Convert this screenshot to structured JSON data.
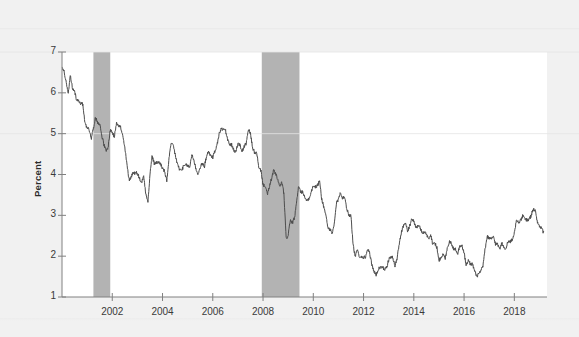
{
  "chart_data": {
    "type": "line",
    "title": "",
    "subtitle": "",
    "xlabel": "",
    "ylabel": "Percent",
    "xlim": [
      2000.0,
      2019.3
    ],
    "ylim": [
      1,
      7
    ],
    "grid": true,
    "legend_position": "none",
    "y_ticks": [
      1,
      2,
      3,
      4,
      5,
      6,
      7
    ],
    "y_tick_labels": [
      "1",
      "2",
      "3",
      "4",
      "5",
      "6",
      "7"
    ],
    "x_ticks": [
      2002,
      2004,
      2006,
      2008,
      2010,
      2012,
      2014,
      2016,
      2018
    ],
    "x_tick_labels": [
      "2002",
      "2004",
      "2006",
      "2008",
      "2010",
      "2012",
      "2014",
      "2016",
      "2018"
    ],
    "line_color": "#4d4d4d",
    "line_width": 1.0,
    "band_color": "#b3b3b3",
    "background_color": "#f1f1f1",
    "plot_background_color": "#ffffff",
    "axis_color": "#808080",
    "annotations": [],
    "shaded_regions": [
      {
        "name": "recession-2001",
        "x_start": 2001.25,
        "x_end": 2001.92
      },
      {
        "name": "recession-2008",
        "x_start": 2007.95,
        "x_end": 2009.45
      }
    ],
    "series": [
      {
        "name": "10-Year Treasury Yield",
        "x": [
          2000.0,
          2000.08,
          2000.17,
          2000.25,
          2000.33,
          2000.42,
          2000.5,
          2000.58,
          2000.67,
          2000.75,
          2000.83,
          2000.92,
          2001.0,
          2001.08,
          2001.17,
          2001.25,
          2001.33,
          2001.42,
          2001.5,
          2001.58,
          2001.67,
          2001.75,
          2001.83,
          2001.92,
          2002.0,
          2002.08,
          2002.17,
          2002.25,
          2002.33,
          2002.42,
          2002.5,
          2002.58,
          2002.67,
          2002.75,
          2002.83,
          2002.92,
          2003.0,
          2003.08,
          2003.17,
          2003.25,
          2003.33,
          2003.42,
          2003.5,
          2003.58,
          2003.67,
          2003.75,
          2003.83,
          2003.92,
          2004.0,
          2004.08,
          2004.17,
          2004.25,
          2004.33,
          2004.42,
          2004.5,
          2004.58,
          2004.67,
          2004.75,
          2004.83,
          2004.92,
          2005.0,
          2005.08,
          2005.17,
          2005.25,
          2005.33,
          2005.42,
          2005.5,
          2005.58,
          2005.67,
          2005.75,
          2005.83,
          2005.92,
          2006.0,
          2006.08,
          2006.17,
          2006.25,
          2006.33,
          2006.42,
          2006.5,
          2006.58,
          2006.67,
          2006.75,
          2006.83,
          2006.92,
          2007.0,
          2007.08,
          2007.17,
          2007.25,
          2007.33,
          2007.42,
          2007.5,
          2007.58,
          2007.67,
          2007.75,
          2007.83,
          2007.92,
          2008.0,
          2008.08,
          2008.17,
          2008.25,
          2008.33,
          2008.42,
          2008.5,
          2008.58,
          2008.67,
          2008.75,
          2008.83,
          2008.92,
          2009.0,
          2009.08,
          2009.17,
          2009.25,
          2009.33,
          2009.42,
          2009.5,
          2009.58,
          2009.67,
          2009.75,
          2009.83,
          2009.92,
          2010.0,
          2010.08,
          2010.17,
          2010.25,
          2010.33,
          2010.42,
          2010.5,
          2010.58,
          2010.67,
          2010.75,
          2010.83,
          2010.92,
          2011.0,
          2011.08,
          2011.17,
          2011.25,
          2011.33,
          2011.42,
          2011.5,
          2011.58,
          2011.67,
          2011.75,
          2011.83,
          2011.92,
          2012.0,
          2012.08,
          2012.17,
          2012.25,
          2012.33,
          2012.42,
          2012.5,
          2012.58,
          2012.67,
          2012.75,
          2012.83,
          2012.92,
          2013.0,
          2013.08,
          2013.17,
          2013.25,
          2013.33,
          2013.42,
          2013.5,
          2013.58,
          2013.67,
          2013.75,
          2013.83,
          2013.92,
          2014.0,
          2014.08,
          2014.17,
          2014.25,
          2014.33,
          2014.42,
          2014.5,
          2014.58,
          2014.67,
          2014.75,
          2014.83,
          2014.92,
          2015.0,
          2015.08,
          2015.17,
          2015.25,
          2015.33,
          2015.42,
          2015.5,
          2015.58,
          2015.67,
          2015.75,
          2015.83,
          2015.92,
          2016.0,
          2016.08,
          2016.17,
          2016.25,
          2016.33,
          2016.42,
          2016.5,
          2016.58,
          2016.67,
          2016.75,
          2016.83,
          2016.92,
          2017.0,
          2017.08,
          2017.17,
          2017.25,
          2017.33,
          2017.42,
          2017.5,
          2017.58,
          2017.67,
          2017.75,
          2017.83,
          2017.92,
          2018.0,
          2018.08,
          2018.17,
          2018.25,
          2018.33,
          2018.42,
          2018.5,
          2018.58,
          2018.67,
          2018.75,
          2018.83,
          2018.92,
          2019.0,
          2019.08,
          2019.17
        ],
        "values": [
          6.66,
          6.52,
          6.26,
          6.0,
          6.44,
          6.1,
          6.05,
          5.83,
          5.8,
          5.74,
          5.72,
          5.24,
          5.16,
          5.1,
          4.89,
          5.14,
          5.39,
          5.28,
          5.24,
          4.97,
          4.73,
          4.57,
          4.65,
          5.09,
          5.04,
          4.91,
          5.28,
          5.21,
          5.16,
          4.93,
          4.65,
          4.26,
          3.87,
          3.94,
          4.05,
          4.03,
          4.05,
          3.9,
          3.81,
          3.96,
          3.57,
          3.33,
          3.98,
          4.45,
          4.27,
          4.29,
          4.3,
          4.27,
          4.15,
          4.08,
          3.83,
          4.35,
          4.72,
          4.73,
          4.5,
          4.28,
          4.13,
          4.1,
          4.19,
          4.23,
          4.22,
          4.17,
          4.5,
          4.34,
          4.14,
          4.0,
          4.18,
          4.26,
          4.2,
          4.46,
          4.54,
          4.47,
          4.42,
          4.57,
          4.72,
          4.99,
          5.11,
          5.11,
          5.09,
          4.88,
          4.72,
          4.73,
          4.6,
          4.56,
          4.76,
          4.72,
          4.56,
          4.69,
          4.75,
          5.1,
          5.0,
          4.67,
          4.52,
          4.53,
          4.15,
          4.1,
          3.74,
          3.74,
          3.51,
          3.68,
          3.88,
          4.1,
          4.01,
          3.89,
          3.69,
          3.81,
          3.53,
          2.42,
          2.52,
          2.87,
          2.82,
          2.93,
          3.29,
          3.72,
          3.56,
          3.59,
          3.4,
          3.39,
          3.4,
          3.59,
          3.73,
          3.69,
          3.73,
          3.85,
          3.42,
          3.2,
          3.01,
          2.7,
          2.65,
          2.54,
          2.76,
          3.29,
          3.39,
          3.58,
          3.41,
          3.46,
          3.17,
          3.0,
          3.0,
          2.3,
          1.98,
          2.15,
          2.01,
          1.98,
          1.97,
          1.97,
          2.17,
          2.05,
          1.8,
          1.62,
          1.53,
          1.68,
          1.72,
          1.75,
          1.65,
          1.72,
          1.91,
          1.98,
          1.96,
          1.76,
          1.93,
          2.3,
          2.58,
          2.74,
          2.81,
          2.62,
          2.72,
          2.9,
          2.86,
          2.71,
          2.72,
          2.71,
          2.56,
          2.6,
          2.54,
          2.42,
          2.53,
          2.3,
          2.33,
          2.21,
          1.88,
          1.98,
          2.04,
          1.94,
          2.2,
          2.36,
          2.32,
          2.17,
          2.17,
          2.07,
          2.26,
          2.24,
          2.09,
          1.78,
          1.89,
          1.81,
          1.81,
          1.64,
          1.5,
          1.56,
          1.63,
          1.76,
          2.14,
          2.49,
          2.43,
          2.42,
          2.48,
          2.3,
          2.3,
          2.19,
          2.32,
          2.21,
          2.2,
          2.36,
          2.35,
          2.4,
          2.58,
          2.86,
          2.84,
          2.87,
          2.98,
          2.91,
          2.89,
          2.89,
          3.0,
          3.15,
          3.12,
          2.83,
          2.71,
          2.68,
          2.57
        ]
      }
    ]
  },
  "axis": {
    "y_label": "Percent"
  }
}
